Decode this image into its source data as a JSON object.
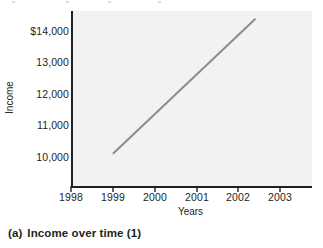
{
  "figure": {
    "caption_label": "(a)",
    "caption_text": "Income over time (1)"
  },
  "chart_data": {
    "type": "line",
    "title": "",
    "xlabel": "Years",
    "ylabel": "Income",
    "xlim": [
      1998,
      2003.7
    ],
    "ylim": [
      9200,
      14900
    ],
    "xticks": [
      1998,
      1999,
      2000,
      2001,
      2002,
      2003
    ],
    "xtick_labels": [
      "1998",
      "1999",
      "2000",
      "2001",
      "2002",
      "2003"
    ],
    "yticks": [
      10000,
      11000,
      12000,
      13000,
      14000
    ],
    "ytick_labels": [
      "10,000",
      "11,000",
      "12,000",
      "13,000",
      "$14,000"
    ],
    "grid": false,
    "legend": "none",
    "series": [
      {
        "name": "Income",
        "color": "#8c8c8c",
        "line_width": 2,
        "x": [
          1999,
          2002.4
        ],
        "values": [
          10250,
          14650
        ]
      }
    ]
  },
  "axis_colors": {
    "axis_line": "#231f20",
    "plot_background": "#f2f2f2",
    "page_background": "#ffffff",
    "data_line": "#8c8c8c"
  }
}
